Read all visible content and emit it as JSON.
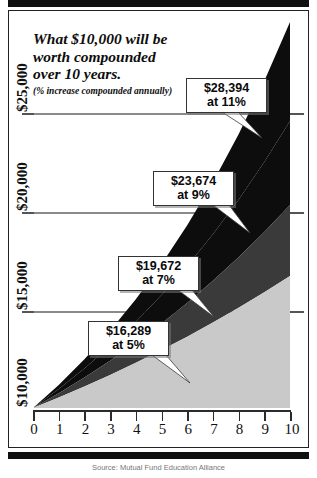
{
  "figure": {
    "title_lines": [
      "What $10,000 will be",
      "worth compounded",
      "over 10 years."
    ],
    "subtitle": "(% increase compounded annually)",
    "source": "Source: Mutual Fund Education Alliance"
  },
  "callouts": [
    {
      "amount": "$28,394",
      "rate": "at 11%"
    },
    {
      "amount": "$23,674",
      "rate": "at 9%"
    },
    {
      "amount": "$19,672",
      "rate": "at 7%"
    },
    {
      "amount": "$16,289",
      "rate": "at 5%"
    }
  ],
  "axes": {
    "y_ticks": [
      "$10,000",
      "$15,000",
      "$20,000",
      "$25,000"
    ],
    "x_ticks": [
      "0",
      "1",
      "2",
      "3",
      "4",
      "5",
      "6",
      "7",
      "8",
      "9",
      "10"
    ]
  },
  "colors": {
    "band_11": "#0d0d0d",
    "band_9": "#0d0d0d",
    "band_7": "#3a3a3a",
    "band_5": "#c9c9c9",
    "gridline": "#8a8a8a",
    "frame": "#222222",
    "rule": "#101010"
  },
  "chart_data": {
    "type": "area",
    "title": "What $10,000 will be worth compounded over 10 years.",
    "subtitle": "(% increase compounded annually)",
    "xlabel": "Years",
    "ylabel": "Value",
    "xlim": [
      0,
      10
    ],
    "ylim": [
      10000,
      28394
    ],
    "x": [
      0,
      1,
      2,
      3,
      4,
      5,
      6,
      7,
      8,
      9,
      10
    ],
    "y_tick_values": [
      10000,
      15000,
      20000,
      25000
    ],
    "x_tick_values": [
      0,
      1,
      2,
      3,
      4,
      5,
      6,
      7,
      8,
      9,
      10
    ],
    "grid": true,
    "legend": "none",
    "annotations": [
      {
        "label": "$28,394 at 11%",
        "x": 10,
        "y": 28394
      },
      {
        "label": "$23,674 at 9%",
        "x": 10,
        "y": 23674
      },
      {
        "label": "$19,672 at 7%",
        "x": 10,
        "y": 19672
      },
      {
        "label": "$16,289 at 5%",
        "x": 10,
        "y": 16289
      }
    ],
    "series": [
      {
        "name": "11%",
        "color": "#0d0d0d",
        "final_value": 28394,
        "values": [
          10000,
          11100,
          12321,
          13676,
          15181,
          16851,
          18704,
          20762,
          23045,
          25580,
          28394
        ]
      },
      {
        "name": "9%",
        "color": "#0d0d0d",
        "final_value": 23674,
        "values": [
          10000,
          10900,
          11881,
          12950,
          14116,
          15386,
          16771,
          18280,
          19926,
          21719,
          23674
        ]
      },
      {
        "name": "7%",
        "color": "#3a3a3a",
        "final_value": 19672,
        "values": [
          10000,
          10700,
          11449,
          12250,
          13108,
          14026,
          15007,
          16058,
          17182,
          18385,
          19672
        ]
      },
      {
        "name": "5%",
        "color": "#c9c9c9",
        "final_value": 16289,
        "values": [
          10000,
          10500,
          11025,
          11576,
          12155,
          12763,
          13401,
          14071,
          14775,
          15513,
          16289
        ]
      }
    ]
  }
}
